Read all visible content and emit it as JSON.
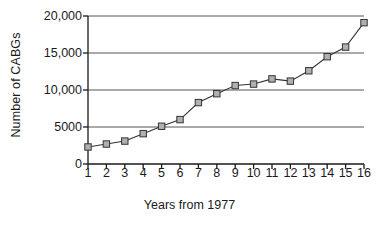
{
  "chart_data": {
    "type": "line",
    "title": "",
    "subtitle": "",
    "xlabel": "Years from 1977",
    "ylabel": "Number of CABGs",
    "x": [
      1,
      2,
      3,
      4,
      5,
      6,
      7,
      8,
      9,
      10,
      11,
      12,
      13,
      14,
      15,
      16
    ],
    "xtick_labels": [
      "1",
      "2",
      "3",
      "4",
      "5",
      "6",
      "7",
      "8",
      "9",
      "10",
      "11",
      "12",
      "13",
      "14",
      "15",
      "16"
    ],
    "xlim": [
      1,
      16
    ],
    "values": [
      2300,
      2700,
      3100,
      4100,
      5100,
      6000,
      8300,
      9500,
      10600,
      10800,
      11500,
      11200,
      12600,
      14500,
      15800,
      19100
    ],
    "ylim": [
      0,
      20000
    ],
    "yticks": [
      0,
      5000,
      10000,
      15000,
      20000
    ],
    "ytick_labels": [
      "0",
      "5000",
      "10,000",
      "15,000",
      "20,000"
    ],
    "grid": "horizontal",
    "legend": "none",
    "marker": "square",
    "marker_face_color": "#b0b0b0",
    "marker_edge_color": "#333333",
    "line_color": "#333333",
    "gridline_color": "#555555",
    "axis_color": "#1a1a1a",
    "annotations": []
  }
}
